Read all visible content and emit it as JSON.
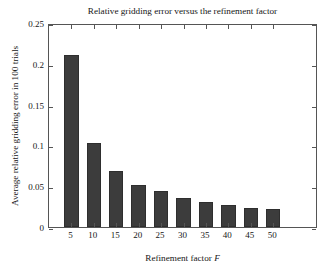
{
  "chart_data": {
    "type": "bar",
    "title": "Relative gridding error versus the refinement factor",
    "xlabel": "Refinement factor F",
    "xlabel_plain": "Refinement factor",
    "xlabel_italic_symbol": "F",
    "ylabel": "Average relative gridding error in 100 trials",
    "categories": [
      "5",
      "10",
      "15",
      "20",
      "25",
      "30",
      "35",
      "40",
      "45",
      "50"
    ],
    "values": [
      0.2105,
      0.1035,
      0.069,
      0.052,
      0.044,
      0.0355,
      0.031,
      0.027,
      0.0235,
      0.0215
    ],
    "xlim": [
      0,
      60
    ],
    "ylim": [
      0,
      0.25
    ],
    "yticks": [
      "0",
      "0.05",
      "0.1",
      "0.15",
      "0.2",
      "0.25"
    ],
    "ytick_values": [
      0,
      0.05,
      0.1,
      0.15,
      0.2,
      0.25
    ],
    "xticks": [
      "5",
      "10",
      "15",
      "20",
      "25",
      "30",
      "35",
      "40",
      "45",
      "50"
    ],
    "xtick_values": [
      5,
      10,
      15,
      20,
      25,
      30,
      35,
      40,
      45,
      50
    ],
    "grid": false,
    "legend": null,
    "bar_color": "#3c3c3c",
    "axis_color": "#555555",
    "background_color": "#ffffff",
    "bar_width_units": 3.2
  }
}
